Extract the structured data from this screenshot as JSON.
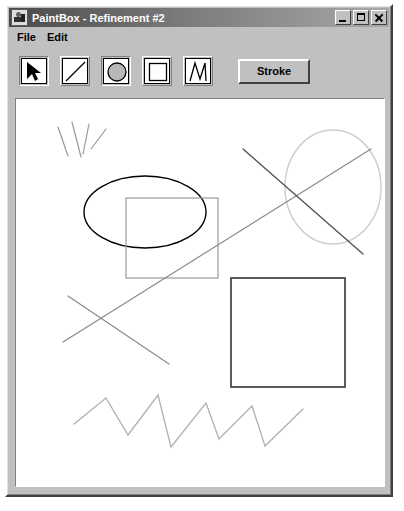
{
  "window": {
    "title": "PaintBox - Refinement #2",
    "app_icon": "paintbox-app-icon",
    "controls": {
      "minimize_label": "Minimize",
      "maximize_label": "Maximize",
      "close_label": "Close"
    }
  },
  "menu": {
    "items": [
      {
        "label": "File"
      },
      {
        "label": "Edit"
      }
    ]
  },
  "toolbar": {
    "tools": [
      {
        "id": "select",
        "icon": "arrow-cursor-icon",
        "label": "Select",
        "selected": true
      },
      {
        "id": "line",
        "icon": "line-icon",
        "label": "Line",
        "selected": false
      },
      {
        "id": "ellipse",
        "icon": "ellipse-icon",
        "label": "Ellipse",
        "selected": true
      },
      {
        "id": "rectangle",
        "icon": "rectangle-icon",
        "label": "Rectangle",
        "selected": false
      },
      {
        "id": "polyline",
        "icon": "polyline-icon",
        "label": "Polyline",
        "selected": false
      }
    ],
    "stroke_button_label": "Stroke"
  },
  "canvas": {
    "background": "#ffffff",
    "width": 368,
    "height": 387,
    "shapes": [
      {
        "name": "stroke-mark-1",
        "type": "line",
        "x1": 42,
        "y1": 28,
        "x2": 52,
        "y2": 57,
        "color": "#9a9a9a",
        "width": 1.2
      },
      {
        "name": "stroke-mark-2",
        "type": "line",
        "x1": 56,
        "y1": 23,
        "x2": 65,
        "y2": 58,
        "color": "#9a9a9a",
        "width": 1.2
      },
      {
        "name": "stroke-mark-3",
        "type": "line",
        "x1": 73,
        "y1": 25,
        "x2": 67,
        "y2": 55,
        "color": "#9a9a9a",
        "width": 1.2
      },
      {
        "name": "stroke-mark-4",
        "type": "line",
        "x1": 90,
        "y1": 30,
        "x2": 75,
        "y2": 50,
        "color": "#9a9a9a",
        "width": 1.2
      },
      {
        "name": "ellipse-left-black",
        "type": "ellipse",
        "cx": 129,
        "cy": 113,
        "rx": 61,
        "ry": 36,
        "color": "#000000",
        "width": 1.4
      },
      {
        "name": "rectangle-gray-overlap",
        "type": "rect",
        "x": 110,
        "y": 99,
        "w": 92,
        "h": 80,
        "color": "#9a9a9a",
        "width": 1.2
      },
      {
        "name": "ellipse-right-light",
        "type": "ellipse",
        "cx": 317,
        "cy": 88,
        "rx": 48,
        "ry": 57,
        "color": "#cccccc",
        "width": 1.4
      },
      {
        "name": "line-long-diagonal",
        "type": "line",
        "x1": 47,
        "y1": 243,
        "x2": 355,
        "y2": 50,
        "color": "#8a8a8a",
        "width": 1.2
      },
      {
        "name": "line-cross-upper",
        "type": "line",
        "x1": 227,
        "y1": 50,
        "x2": 347,
        "y2": 155,
        "color": "#555555",
        "width": 1.4
      },
      {
        "name": "line-cross-lower",
        "type": "line",
        "x1": 52,
        "y1": 197,
        "x2": 153,
        "y2": 265,
        "color": "#8a8a8a",
        "width": 1.2
      },
      {
        "name": "rectangle-dark",
        "type": "rect",
        "x": 215,
        "y": 179,
        "w": 114,
        "h": 109,
        "color": "#4a4a4a",
        "width": 1.8
      },
      {
        "name": "polyline-zigzag",
        "type": "polyline",
        "color": "#b0b0b0",
        "width": 1.3,
        "points": [
          [
            58,
            325
          ],
          [
            90,
            299
          ],
          [
            112,
            336
          ],
          [
            142,
            296
          ],
          [
            155,
            348
          ],
          [
            190,
            304
          ],
          [
            203,
            340
          ],
          [
            236,
            307
          ],
          [
            249,
            347
          ],
          [
            287,
            310
          ]
        ]
      }
    ]
  }
}
